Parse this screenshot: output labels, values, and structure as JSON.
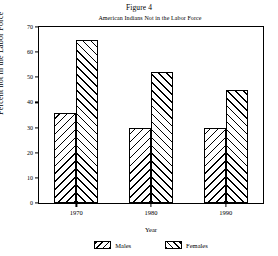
{
  "figure": {
    "label": "Figure 4"
  },
  "chart_data": {
    "type": "bar",
    "title": "American Indians Not in the Labor Force",
    "xlabel": "Year",
    "ylabel": "Percent not in the Labor Force",
    "categories": [
      "1970",
      "1980",
      "1990"
    ],
    "series": [
      {
        "name": "Males",
        "values": [
          36,
          30,
          30
        ],
        "hatch": "backslash"
      },
      {
        "name": "Females",
        "values": [
          65,
          52,
          45
        ],
        "hatch": "slash"
      }
    ],
    "ylim": [
      0,
      70
    ],
    "yticks": [
      0,
      10,
      20,
      30,
      40,
      50,
      60,
      70
    ],
    "grid": false,
    "legend_position": "bottom-center",
    "colors": {
      "ink": "#000000",
      "background": "#ffffff"
    }
  }
}
